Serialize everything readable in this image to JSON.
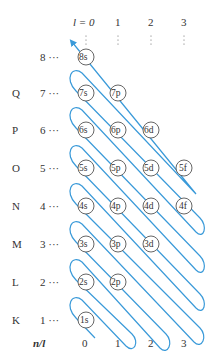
{
  "header": {
    "l_label": "l = 0",
    "l_values": [
      "1",
      "2",
      "3"
    ]
  },
  "rows": [
    {
      "shell": "",
      "n": "8 ···",
      "orbitals": [
        "8s"
      ]
    },
    {
      "shell": "Q",
      "n": "7 ···",
      "orbitals": [
        "7s",
        "7p"
      ]
    },
    {
      "shell": "P",
      "n": "6 ···",
      "orbitals": [
        "6s",
        "6p",
        "6d"
      ]
    },
    {
      "shell": "O",
      "n": "5 ···",
      "orbitals": [
        "5s",
        "5p",
        "5d",
        "5f"
      ]
    },
    {
      "shell": "N",
      "n": "4 ···",
      "orbitals": [
        "4s",
        "4p",
        "4d",
        "4f"
      ]
    },
    {
      "shell": "M",
      "n": "3 ···",
      "orbitals": [
        "3s",
        "3p",
        "3d"
      ]
    },
    {
      "shell": "L",
      "n": "2 ···",
      "orbitals": [
        "2s",
        "2p"
      ]
    },
    {
      "shell": "K",
      "n": "1 ···",
      "orbitals": [
        "1s"
      ]
    }
  ],
  "footer": {
    "axis_label": "n/l",
    "l_values": [
      "0",
      "1",
      "2",
      "3"
    ]
  },
  "colors": {
    "arrow": "#3a9ad9",
    "text": "#333333"
  }
}
